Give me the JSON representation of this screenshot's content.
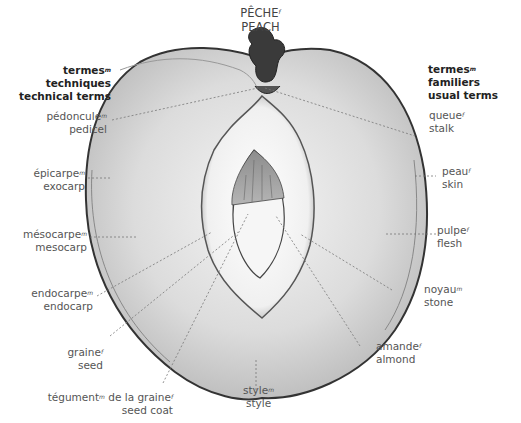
{
  "title": {
    "fr": "PÊCHE",
    "fr_gender": "f",
    "en": "PEACH"
  },
  "headers": {
    "left": {
      "fr": "termes",
      "fr_gender": "m",
      "fr_rest": " techniques",
      "en": "technical terms"
    },
    "right": {
      "fr": "termes",
      "fr_gender": "m",
      "fr_rest": " familiers",
      "en": "usual terms"
    }
  },
  "labels_left": [
    {
      "fr": "pédoncule",
      "g": "m",
      "en": "pedicel"
    },
    {
      "fr": "épicarpe",
      "g": "m",
      "en": "exocarp"
    },
    {
      "fr": "mésocarpe",
      "g": "m",
      "en": "mesocarp"
    },
    {
      "fr": "endocarpe",
      "g": "m",
      "en": "endocarp"
    },
    {
      "fr": "graine",
      "g": "f",
      "en": "seed"
    },
    {
      "fr": "tégument",
      "g": "m",
      "fr_rest": " de la graine",
      "g2": "f",
      "en": "seed coat"
    }
  ],
  "labels_bottom": [
    {
      "fr": "style",
      "g": "m",
      "en": "style"
    }
  ],
  "labels_right": [
    {
      "fr": "queue",
      "g": "f",
      "en": "stalk"
    },
    {
      "fr": "peau",
      "g": "f",
      "en": "skin"
    },
    {
      "fr": "pulpe",
      "g": "f",
      "en": "flesh"
    },
    {
      "fr": "noyau",
      "g": "m",
      "en": "stone"
    },
    {
      "fr": "amande",
      "g": "f",
      "en": "almond"
    }
  ]
}
